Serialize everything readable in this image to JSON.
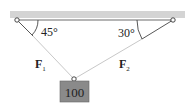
{
  "diagram": {
    "type": "statics-free-body",
    "ceiling": {
      "color": "#d4d4d4"
    },
    "angles": {
      "left": "45°",
      "right": "30°"
    },
    "forces": {
      "left": {
        "symbol": "F",
        "subscript": "1"
      },
      "right": {
        "symbol": "F",
        "subscript": "2"
      }
    },
    "weight": {
      "value": "100",
      "fill": "#8a8a8a"
    },
    "colors": {
      "rope": "#c8c8c8",
      "line": "#333333",
      "arc": "#444444"
    }
  }
}
